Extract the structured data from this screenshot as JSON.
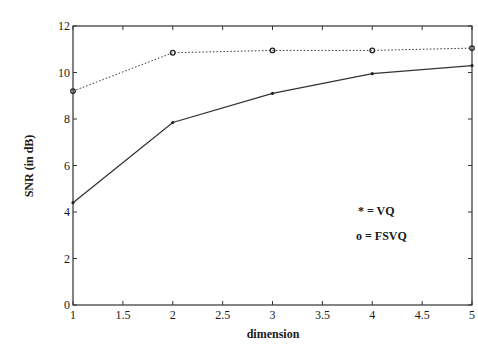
{
  "chart_data": {
    "type": "line",
    "title": "",
    "xlabel": "dimension",
    "ylabel": "SNR (in dB)",
    "xlim": [
      1,
      5
    ],
    "ylim": [
      0,
      12
    ],
    "xticks": [
      "1",
      "1.5",
      "2",
      "2.5",
      "3",
      "3.5",
      "4",
      "4.5",
      "5"
    ],
    "yticks": [
      "0",
      "2",
      "4",
      "6",
      "8",
      "10",
      "12"
    ],
    "grid": false,
    "x": [
      1,
      2,
      3,
      4,
      5
    ],
    "series": [
      {
        "name": "VQ",
        "marker": "*",
        "line_style": "solid",
        "values": [
          4.4,
          7.85,
          9.1,
          9.95,
          10.3
        ]
      },
      {
        "name": "FSVQ",
        "marker": "o",
        "line_style": "dotted",
        "values": [
          9.2,
          10.85,
          10.95,
          10.95,
          11.05
        ]
      }
    ],
    "legend": {
      "position": "inside-right",
      "entries": [
        "* = VQ",
        "o = FSVQ"
      ]
    }
  }
}
